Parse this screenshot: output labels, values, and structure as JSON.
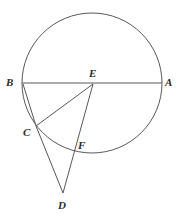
{
  "figure": {
    "width": 177,
    "height": 216,
    "background_color": "#ffffff",
    "stroke_color": "#585858",
    "label_color": "#2b2b2b",
    "stroke_width": 1
  },
  "circle": {
    "name": "main-circle",
    "cx": 92,
    "cy": 83,
    "r": 70
  },
  "points": [
    {
      "id": "A",
      "label": "A",
      "x": 162,
      "y": 83,
      "label_x": 165,
      "label_y": 77
    },
    {
      "id": "B",
      "label": "B",
      "x": 22,
      "y": 83,
      "label_x": 6,
      "label_y": 77
    },
    {
      "id": "C",
      "label": "C",
      "x": 35,
      "y": 125,
      "label_x": 23,
      "label_y": 127
    },
    {
      "id": "D",
      "label": "D",
      "x": 63,
      "y": 194,
      "label_x": 58,
      "label_y": 200
    },
    {
      "id": "E",
      "label": "E",
      "x": 93,
      "y": 83,
      "label_x": 89,
      "label_y": 68
    },
    {
      "id": "F",
      "label": "F",
      "x": 73,
      "y": 147,
      "label_x": 78,
      "label_y": 140
    }
  ],
  "segments": [
    {
      "name": "segment-BA",
      "from": "B",
      "to": "A",
      "x1": 22,
      "y1": 83,
      "x2": 162,
      "y2": 83
    },
    {
      "name": "segment-BC",
      "from": "B",
      "to": "C",
      "x1": 23,
      "y1": 84,
      "x2": 36,
      "y2": 126
    },
    {
      "name": "segment-CE",
      "from": "C",
      "to": "E",
      "x1": 36,
      "y1": 126,
      "x2": 93,
      "y2": 84
    },
    {
      "name": "segment-CD",
      "from": "C",
      "to": "D",
      "x1": 36,
      "y1": 126,
      "x2": 63,
      "y2": 193
    },
    {
      "name": "segment-ED",
      "from": "E",
      "to": "D",
      "x1": 93,
      "y1": 84,
      "x2": 63,
      "y2": 193
    }
  ]
}
